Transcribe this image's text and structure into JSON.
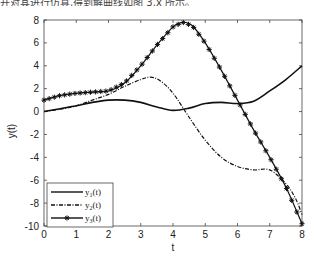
{
  "caption_fragment": "并对其进行仿真,得到解曲线如图 3.x 所示。",
  "chart_data": {
    "type": "line",
    "title": "",
    "xlabel": "t",
    "ylabel": "y(t)",
    "xlim": [
      0,
      8
    ],
    "ylim": [
      -10,
      8
    ],
    "xticks": [
      0,
      1,
      2,
      3,
      4,
      5,
      6,
      7,
      8
    ],
    "yticks": [
      -10,
      -8,
      -6,
      -4,
      -2,
      0,
      2,
      4,
      6,
      8
    ],
    "grid": false,
    "legend_position": "lower left",
    "series": [
      {
        "name": "y1(t)",
        "label_main": "y",
        "label_sub": "1",
        "label_tail": "(t)",
        "style": "solid",
        "marker": "none",
        "x": [
          0,
          0.5,
          1,
          1.5,
          2,
          2.5,
          3,
          3.5,
          4,
          4.5,
          5,
          5.5,
          6,
          6.5,
          7,
          7.5,
          8
        ],
        "values": [
          0,
          0.25,
          0.5,
          0.8,
          1.0,
          1.0,
          0.8,
          0.4,
          0.1,
          0.3,
          0.7,
          0.8,
          0.7,
          0.9,
          1.8,
          2.8,
          4.0
        ]
      },
      {
        "name": "y2(t)",
        "label_main": "y",
        "label_sub": "2",
        "label_tail": "(t)",
        "style": "dashdot",
        "marker": "none",
        "x": [
          0,
          0.5,
          1,
          1.5,
          2,
          2.5,
          3,
          3.3,
          3.6,
          4,
          4.5,
          5,
          5.5,
          6,
          6.5,
          7,
          7.5,
          7.8,
          8
        ],
        "values": [
          0,
          0.2,
          0.5,
          1.0,
          1.5,
          2.2,
          2.8,
          3.0,
          2.7,
          1.6,
          -0.5,
          -2.5,
          -4.0,
          -4.8,
          -5.1,
          -5.1,
          -6.3,
          -7.6,
          -9.0
        ]
      },
      {
        "name": "y3(t)",
        "label_main": "y",
        "label_sub": "3",
        "label_tail": "(t)",
        "style": "solid",
        "marker": "asterisk",
        "x": [
          0,
          0.5,
          1,
          1.5,
          2,
          2.5,
          3,
          3.5,
          4,
          4.3,
          4.6,
          5,
          5.5,
          6,
          6.5,
          7,
          7.5,
          8
        ],
        "values": [
          1.0,
          1.4,
          1.6,
          1.7,
          1.8,
          2.5,
          4.0,
          5.8,
          7.4,
          7.8,
          7.5,
          6.0,
          3.6,
          1.0,
          -1.6,
          -4.0,
          -6.6,
          -9.8
        ]
      }
    ]
  }
}
